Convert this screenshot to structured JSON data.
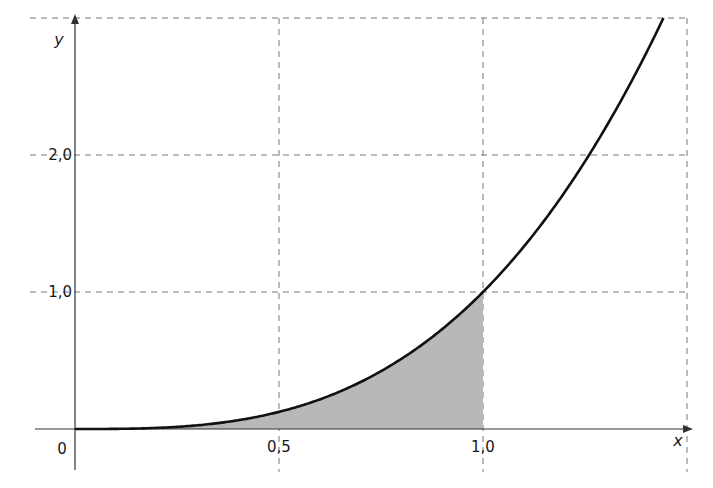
{
  "chart_data": {
    "type": "line",
    "title": "",
    "function": "y = x^3",
    "xlabel": "x",
    "ylabel": "y",
    "xlim": [
      0,
      1.5
    ],
    "ylim": [
      0,
      3.0
    ],
    "grid": true,
    "x_ticks": [
      {
        "value": 0.5,
        "label": "0,5"
      },
      {
        "value": 1.0,
        "label": "1,0"
      }
    ],
    "y_ticks": [
      {
        "value": 1.0,
        "label": "1,0"
      },
      {
        "value": 2.0,
        "label": "2,0"
      }
    ],
    "origin_label": "0",
    "series": [
      {
        "name": "y = x^3",
        "x": [
          0,
          0.25,
          0.5,
          0.75,
          1.0,
          1.25,
          1.442
        ],
        "y": [
          0,
          0.016,
          0.125,
          0.422,
          1.0,
          1.953,
          3.0
        ]
      }
    ],
    "shaded_region": {
      "from_x": 0,
      "to_x": 1.0,
      "description": "area under curve between x=0 and x=1"
    }
  },
  "colors": {
    "curve": "#111111",
    "grid": "#777777",
    "shade": "#b8b8b8",
    "axis": "#333333"
  }
}
